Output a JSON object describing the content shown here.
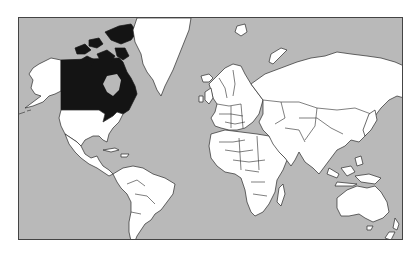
{
  "map": {
    "type": "world political outline map",
    "projection": "Mercator",
    "highlighted_country": "Canada",
    "colors": {
      "ocean": "#b9b9b9",
      "land": "#ffffff",
      "highlight": "#141414",
      "border": "#2a2a2a",
      "frame": "#444444",
      "background": "#ffffff"
    },
    "regions": [
      {
        "name": "Canada",
        "highlighted": true
      },
      {
        "name": "Alaska (USA)",
        "highlighted": false
      },
      {
        "name": "United States",
        "highlighted": false
      },
      {
        "name": "Greenland",
        "highlighted": false
      },
      {
        "name": "Central America & Caribbean",
        "highlighted": false
      },
      {
        "name": "South America",
        "highlighted": false
      },
      {
        "name": "Europe",
        "highlighted": false
      },
      {
        "name": "Africa",
        "highlighted": false
      },
      {
        "name": "Russia & Asia",
        "highlighted": false
      },
      {
        "name": "Middle East & India",
        "highlighted": false
      },
      {
        "name": "Southeast Asia & Indonesia",
        "highlighted": false
      },
      {
        "name": "Australia",
        "highlighted": false
      },
      {
        "name": "New Zealand",
        "highlighted": false
      },
      {
        "name": "Madagascar",
        "highlighted": false
      },
      {
        "name": "Iceland",
        "highlighted": false
      },
      {
        "name": "Japan",
        "highlighted": false
      }
    ]
  }
}
